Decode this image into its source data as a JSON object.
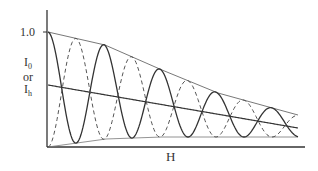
{
  "chart_data": {
    "type": "line",
    "title": "",
    "xlabel": "H",
    "ylabel": "I0 or Ih",
    "ylabel_parts": {
      "main1": "I",
      "sub1": "0",
      "or": "or",
      "main2": "I",
      "sub2": "h"
    },
    "y_tick_labels": [
      "1.0"
    ],
    "ylim": [
      0,
      1.0
    ],
    "grid": false,
    "legend": null,
    "series": [
      {
        "name": "I0",
        "style": "solid",
        "start_phase": "max",
        "half_periods": 9
      },
      {
        "name": "Ih",
        "style": "dashed",
        "start_phase": "min",
        "half_periods": 9
      },
      {
        "name": "upper envelope",
        "style": "thin"
      },
      {
        "name": "lower envelope",
        "style": "thin"
      },
      {
        "name": "mean intensity",
        "style": "solid"
      }
    ],
    "geometry_px": {
      "x0": 48,
      "x1": 298,
      "upper_env": [
        [
          48,
          32
        ],
        [
          105,
          45
        ],
        [
          162,
          70
        ],
        [
          218,
          93
        ],
        [
          276,
          109
        ],
        [
          298,
          115
        ]
      ],
      "lower_env": [
        [
          48,
          147
        ],
        [
          106,
          139
        ],
        [
          162,
          137
        ],
        [
          218,
          137
        ],
        [
          298,
          137
        ]
      ],
      "mean_line": [
        [
          48,
          85
        ],
        [
          298,
          128
        ]
      ],
      "half_period_px": 28
    }
  },
  "labels": {
    "tick": "1.0",
    "x": "H",
    "y_main1": "I",
    "y_sub1": "0",
    "y_or": "or",
    "y_main2": "I",
    "y_sub2": "h"
  }
}
